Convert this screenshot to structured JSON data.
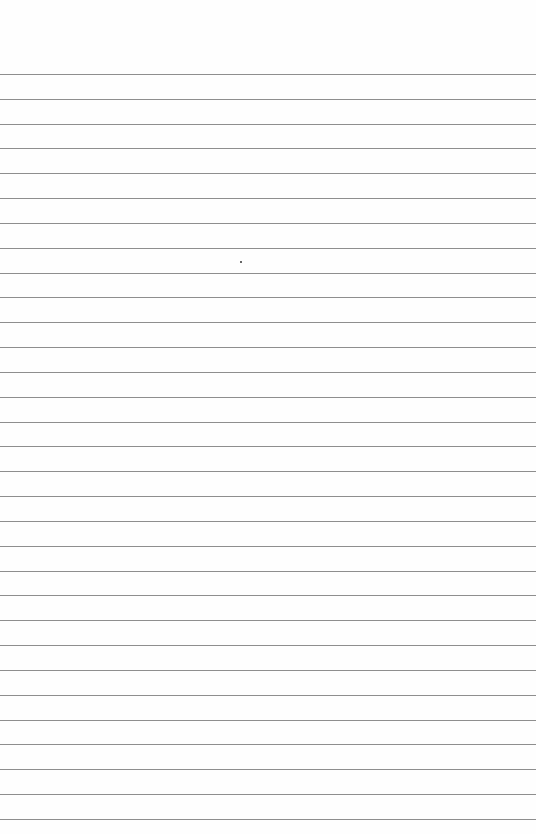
{
  "paper": {
    "type": "lined-paper",
    "background_color": "#fefefe",
    "line_color": "#8e8e8e",
    "line_count": 31,
    "first_line_y": 74,
    "line_spacing": 24.83
  },
  "marks": [
    {
      "type": "dot",
      "x": 240,
      "y": 261
    }
  ]
}
